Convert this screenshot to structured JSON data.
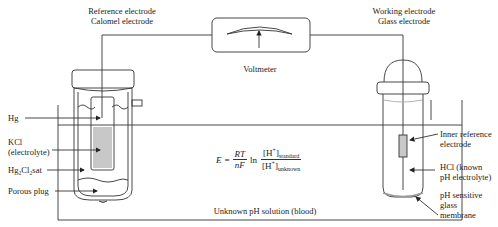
{
  "labels": {
    "reference_electrode": "Reference electrode",
    "calomel_electrode": "Calomel electrode",
    "working_electrode": "Working electrode",
    "glass_electrode": "Glass electrode",
    "voltmeter": "Voltmeter",
    "hg": "Hg",
    "kcl_line1": "KCl",
    "kcl_line2": "(electrolyte)",
    "hg2cl2": "Hg₂Cl₂sat",
    "porous_plug": "Porous plug",
    "inner_ref_line1": "Inner reference",
    "inner_ref_line2": "electrode",
    "hcl_line1": "HCl (known",
    "hcl_line2": "pH electrolyte)",
    "membrane_line1": "pH sensitive",
    "membrane_line2": "glass",
    "membrane_line3": "membrane",
    "solution": "Unknown pH solution (blood)"
  },
  "formula": {
    "lhs": "E",
    "eq": "=",
    "num": "RT",
    "den": "nF",
    "ln": "ln",
    "top_h": "[H",
    "top_plus": "+",
    "top_close": "]",
    "top_sub": "standard",
    "bot_h": "[H",
    "bot_plus": "+",
    "bot_close": "]",
    "bot_sub": "unknown"
  },
  "colors": {
    "line": "#333333",
    "fill_gray": "#c8c8c8"
  }
}
